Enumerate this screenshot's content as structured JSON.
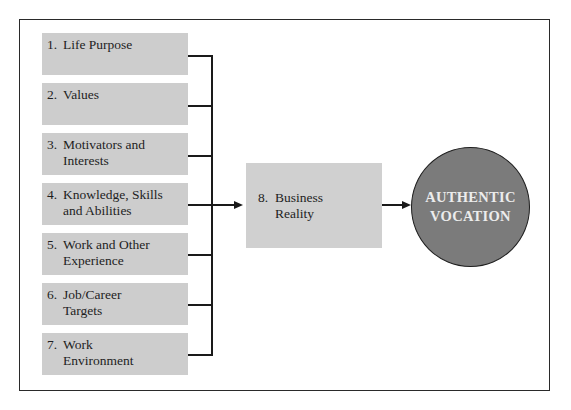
{
  "diagram": {
    "inputs": [
      {
        "number": "1.",
        "line1": "Life Purpose",
        "line2": ""
      },
      {
        "number": "2.",
        "line1": "Values",
        "line2": ""
      },
      {
        "number": "3.",
        "line1": "Motivators and",
        "line2": "Interests"
      },
      {
        "number": "4.",
        "line1": "Knowledge, Skills",
        "line2": "and Abilities"
      },
      {
        "number": "5.",
        "line1": "Work and Other",
        "line2": "Experience"
      },
      {
        "number": "6.",
        "line1": "Job/Career",
        "line2": "Targets"
      },
      {
        "number": "7.",
        "line1": "Work",
        "line2": "Environment"
      }
    ],
    "filter": {
      "number": "8.",
      "line1": "Business",
      "line2": "Reality"
    },
    "outcome": {
      "line1": "AUTHENTIC",
      "line2": "VOCATION"
    },
    "colors": {
      "box_fill": "#cdcdcd",
      "circle_fill": "#7b7b7b",
      "circle_text": "#ececec",
      "lines": "#1a1a1a"
    }
  }
}
